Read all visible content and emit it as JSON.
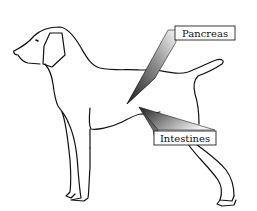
{
  "diagram": {
    "labels": [
      {
        "id": "pancreas",
        "text": "Pancreas"
      },
      {
        "id": "intestines",
        "text": "Intestines"
      }
    ],
    "colors": {
      "outline": "#111111",
      "background": "#ffffff",
      "pointer_dark": "#2a2a2a",
      "pointer_light": "#f2f2f2"
    }
  }
}
